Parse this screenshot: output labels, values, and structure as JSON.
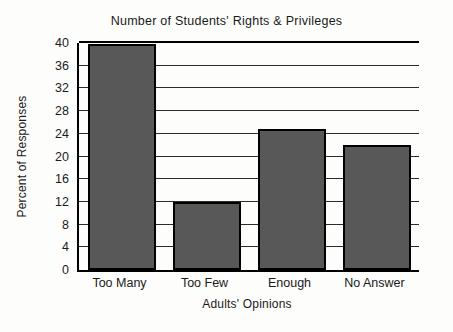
{
  "chart_data": {
    "type": "bar",
    "title": "Number of Students' Rights & Privileges",
    "xlabel": "Adults' Opinions",
    "ylabel": "Percent of Responses",
    "categories": [
      "Too Many",
      "Too Few",
      "Enough",
      "No Answer"
    ],
    "values": [
      39.8,
      11.9,
      24.8,
      22.0
    ],
    "ylim": [
      0,
      40
    ],
    "yticks": [
      0,
      4,
      8,
      12,
      16,
      20,
      24,
      28,
      32,
      36,
      40
    ],
    "ytick_labels": [
      "0",
      "4",
      "8",
      "12",
      "16",
      "20",
      "24",
      "28",
      "32",
      "36",
      "40"
    ],
    "grid": true,
    "legend": false,
    "bar_color": "#585858",
    "bar_edge_color": "#000000",
    "axis_color": "#000000",
    "grid_color": "#2b2b2b",
    "background_color": "#fdfdfb"
  }
}
